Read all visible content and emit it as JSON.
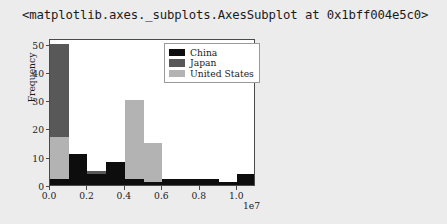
{
  "output": {
    "repr_text": "<matplotlib.axes._subplots.AxesSubplot at 0x1bff004e5c0>",
    "background_color": "#ececed"
  },
  "chart_data": {
    "type": "bar",
    "subtype": "histogram-overlapping",
    "title": "",
    "xlabel": "",
    "ylabel": "Frequency",
    "x_exponent_label": "1e7",
    "xlim": [
      0.0,
      1.1
    ],
    "ylim": [
      0,
      52
    ],
    "xticks": [
      "0.0",
      "0.2",
      "0.4",
      "0.6",
      "0.8",
      "1.0"
    ],
    "xtick_values": [
      0.0,
      0.2,
      0.4,
      0.6,
      0.8,
      1.0
    ],
    "yticks": [
      "0",
      "10",
      "20",
      "30",
      "40",
      "50"
    ],
    "ytick_values": [
      0,
      10,
      20,
      30,
      40,
      50
    ],
    "grid": false,
    "legend_position": "upper right",
    "bin_edges": [
      0.0,
      0.1,
      0.2,
      0.3,
      0.4,
      0.5,
      0.6,
      0.7,
      0.8,
      0.9,
      1.0,
      1.1
    ],
    "series": [
      {
        "name": "China",
        "color": "#0d0d0d",
        "values": [
          2,
          11,
          4,
          8,
          2,
          1,
          2,
          2,
          2,
          1,
          4
        ]
      },
      {
        "name": "Japan",
        "color": "#585858",
        "values": [
          50,
          5,
          5,
          7,
          6,
          0,
          0,
          0,
          0,
          0,
          0
        ]
      },
      {
        "name": "United States",
        "color": "#b3b3b3",
        "values": [
          17,
          3,
          2,
          2,
          30,
          15,
          1,
          0,
          0,
          0,
          0
        ]
      }
    ]
  }
}
